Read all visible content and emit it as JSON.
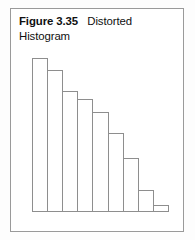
{
  "figure": {
    "caption_number": "Figure 3.35",
    "caption_title": "Distorted Histogram",
    "frame_color": "#9a9a9a",
    "background_color": "#ffffff"
  },
  "chart_data": {
    "type": "bar",
    "title": "Distorted Histogram",
    "xlabel": "",
    "ylabel": "",
    "grid": false,
    "legend": null,
    "axis_visible": {
      "x": true,
      "y": false
    },
    "bar_outline_color": "#8e8e8e",
    "bar_fill_color": "#ffffff",
    "categories": [
      "1",
      "2",
      "3",
      "4",
      "5",
      "6",
      "7",
      "8",
      "9"
    ],
    "values": [
      153,
      141,
      120,
      112,
      99,
      78,
      53,
      21,
      6
    ],
    "ylim": [
      0,
      155
    ],
    "tick_labels": {
      "x": [],
      "y": []
    },
    "annotations": []
  }
}
